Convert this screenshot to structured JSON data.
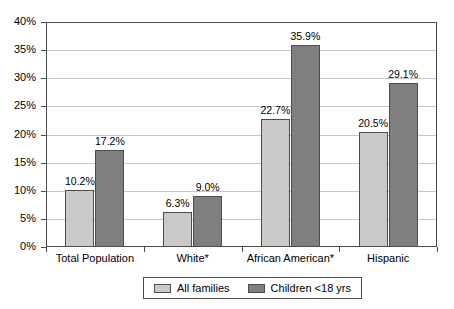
{
  "chart_data": {
    "type": "bar",
    "title": "",
    "subtitle": "",
    "xlabel": "",
    "ylabel": "",
    "ylim": [
      0,
      40
    ],
    "grid": true,
    "legend_position": "bottom",
    "categories": [
      "Total Population",
      "White*",
      "African American*",
      "Hispanic"
    ],
    "ytick_labels": [
      "0%",
      "5%",
      "10%",
      "15%",
      "20%",
      "25%",
      "30%",
      "35%",
      "40%"
    ],
    "ytick_values": [
      0,
      5,
      10,
      15,
      20,
      25,
      30,
      35,
      40
    ],
    "series": [
      {
        "name": "All families",
        "color": "#c9c9c9",
        "values": [
          10.2,
          6.3,
          22.7,
          20.5
        ],
        "labels": [
          "10.2%",
          "6.3%",
          "22.7%",
          "20.5%"
        ]
      },
      {
        "name": "Children <18 yrs",
        "color": "#7f7f7f",
        "values": [
          17.2,
          9.0,
          35.9,
          29.1
        ],
        "labels": [
          "17.2%",
          "9.0%",
          "35.9%",
          "29.1%"
        ]
      }
    ]
  },
  "legend": {
    "items": [
      {
        "label": "All families",
        "swatch": "#c9c9c9"
      },
      {
        "label": "Children <18 yrs",
        "swatch": "#7f7f7f"
      }
    ]
  }
}
